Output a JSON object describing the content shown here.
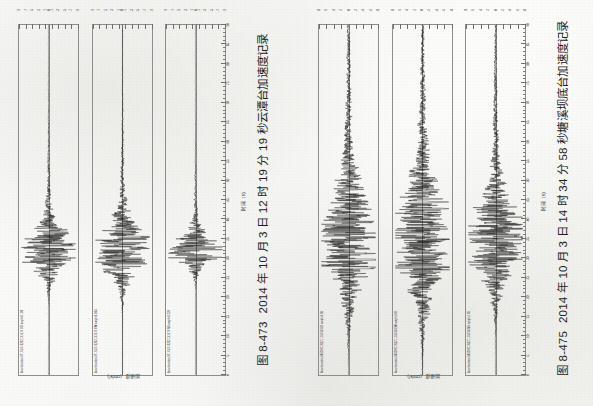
{
  "page": {
    "background_color": "#fbfbfa",
    "orientation": "rotated-90-ccw",
    "scan_of": "printed book page"
  },
  "figures": [
    {
      "id": "fig-8-473",
      "caption_number": "图 8-473",
      "caption_text": "2014 年 10 月 3 日 12 时 19 分 19 秒云潭台加速度记录",
      "axis_x_title": "时间（s）",
      "axis_y_title": "加速度（cm/s²）",
      "x_ticks": [
        0,
        5,
        10,
        15,
        20,
        25,
        30,
        35,
        40,
        45,
        50,
        55,
        60,
        65,
        70,
        75,
        80,
        85,
        90
      ],
      "x_tick_labels": [
        "0",
        "5",
        "10",
        "15",
        "20",
        "25",
        "30",
        "35",
        "40",
        "45",
        "50",
        "55",
        "60",
        "65",
        "70",
        "75",
        "80",
        "85",
        "90"
      ],
      "panels": [
        {
          "note": "Acceleration 371XLX10202131819 UD ampl=0.180",
          "component": "UD",
          "y_tick_labels": [
            "-9",
            "-7",
            "-5",
            "-3",
            "-1",
            "0",
            "1",
            "3",
            "5",
            "7",
            "9"
          ],
          "y_values": [
            -9,
            -7,
            -5,
            -3,
            -1,
            0,
            1,
            3,
            5,
            7,
            9
          ],
          "peak_amplitude": 0.18,
          "event_center_s": 32,
          "event_width_s": 10
        },
        {
          "note": "Acceleration 371XLX10202131819 EW ampl=0.363",
          "component": "EW",
          "y_tick_labels": [
            "-9",
            "-7",
            "-5",
            "-3",
            "-1",
            "0",
            "1",
            "3",
            "5",
            "7",
            "9"
          ],
          "y_values": [
            -9,
            -7,
            -5,
            -3,
            -1,
            0,
            1,
            3,
            5,
            7,
            9
          ],
          "peak_amplitude": 0.363,
          "event_center_s": 32,
          "event_width_s": 12
        },
        {
          "note": "Acceleration 371XLX10202131819 NS ampl=0.228",
          "component": "NS",
          "y_tick_labels": [
            "-9",
            "-7",
            "-5",
            "-3",
            "-1",
            "0",
            "1",
            "3",
            "5",
            "7",
            "9"
          ],
          "y_values": [
            -9,
            -7,
            -5,
            -3,
            -1,
            0,
            1,
            3,
            5,
            7,
            9
          ],
          "peak_amplitude": 0.228,
          "event_center_s": 32,
          "event_width_s": 7
        }
      ]
    },
    {
      "id": "fig-8-475",
      "caption_number": "图 8-475",
      "caption_text": "2014 年 10 月 3 日 14 时 34 分 58 秒塘溪坝底台加速度记录",
      "axis_x_title": "时间（s）",
      "axis_y_title": "加速度（cm/s²）",
      "x_ticks": [
        0,
        5,
        10,
        15,
        20,
        25,
        30,
        35,
        40,
        45,
        50,
        55,
        60,
        65,
        70,
        75,
        80,
        85,
        90
      ],
      "x_tick_labels": [
        "0",
        "5",
        "10",
        "15",
        "20",
        "25",
        "30",
        "35",
        "40",
        "45",
        "50",
        "55",
        "60",
        "65",
        "70",
        "75",
        "80",
        "85",
        "90"
      ],
      "panels": [
        {
          "note": "Acceleration 385DXC16321143458 UD ampl=3.56",
          "component": "UD",
          "y_tick_labels": [
            "-8",
            "-6",
            "-4",
            "-2",
            "0",
            "2",
            "4",
            "6",
            "8"
          ],
          "y_values": [
            -8,
            -6,
            -4,
            -2,
            0,
            2,
            4,
            6,
            8
          ],
          "peak_amplitude": 3.56,
          "event_center_s": 34,
          "event_width_s": 22
        },
        {
          "note": "Acceleration 385DXC16321143458 EW ampl=3.04",
          "component": "EW",
          "y_tick_labels": [
            "-8",
            "-6",
            "-4",
            "-2",
            "0",
            "2",
            "4",
            "6",
            "8"
          ],
          "y_values": [
            -8,
            -6,
            -4,
            -2,
            0,
            2,
            4,
            6,
            8
          ],
          "peak_amplitude": 3.04,
          "event_center_s": 34,
          "event_width_s": 24
        },
        {
          "note": "Acceleration 385DXC16321143458 NS ampl=2.05",
          "component": "NS",
          "y_tick_labels": [
            "-8",
            "-6",
            "-4",
            "-2",
            "0",
            "2",
            "4",
            "6",
            "8"
          ],
          "y_values": [
            -8,
            -6,
            -4,
            -2,
            0,
            2,
            4,
            6,
            8
          ],
          "peak_amplitude": 2.05,
          "event_center_s": 34,
          "event_width_s": 18
        }
      ]
    }
  ],
  "chart_data": {
    "type": "line",
    "xlabel": "时间（s）",
    "ylabel": "加速度（cm/s²）",
    "xlim": [
      0,
      90
    ],
    "grid": false,
    "legend": "none",
    "charts": [
      {
        "figure": "图 8-473",
        "subtitle": "2014 年 10 月 3 日 12 时 19 分 19 秒云潭台加速度记录",
        "ylim": [
          -10,
          10
        ],
        "series": [
          {
            "name": "UD ampl=0.180",
            "peak": 0.18,
            "center_s": 32
          },
          {
            "name": "EW ampl=0.363",
            "peak": 0.363,
            "center_s": 32
          },
          {
            "name": "NS ampl=0.228",
            "peak": 0.228,
            "center_s": 32
          }
        ]
      },
      {
        "figure": "图 8-475",
        "subtitle": "2014 年 10 月 3 日 14 时 34 分 58 秒塘溪坝底台加速度记录",
        "ylim": [
          -9,
          9
        ],
        "series": [
          {
            "name": "UD ampl=3.56",
            "peak": 3.56,
            "center_s": 34
          },
          {
            "name": "EW ampl=3.04",
            "peak": 3.04,
            "center_s": 34
          },
          {
            "name": "NS ampl=2.05",
            "peak": 2.05,
            "center_s": 34
          }
        ]
      }
    ]
  }
}
